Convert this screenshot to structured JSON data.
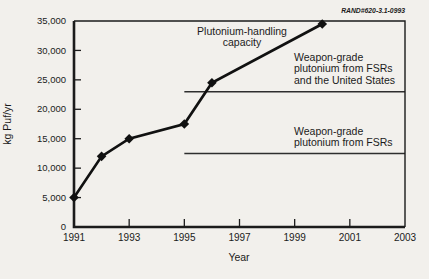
{
  "figure": {
    "tag": "RAND#620-3.1-0993",
    "background_color": "#f2f0ec",
    "ink_color": "#1b1b1b"
  },
  "chart_data": {
    "type": "line",
    "title": "",
    "xlabel": "Year",
    "ylabel": "kg Puf/yr",
    "xlim": [
      1991,
      2003
    ],
    "ylim": [
      0,
      35000
    ],
    "grid": false,
    "legend": "none (labels annotated on plot)",
    "x_ticks": [
      1991,
      1993,
      1995,
      1997,
      1999,
      2001,
      2003
    ],
    "y_ticks": [
      0,
      5000,
      10000,
      15000,
      20000,
      25000,
      30000,
      35000
    ],
    "y_tick_labels": [
      "0",
      "5,000",
      "10,000",
      "15,000",
      "20,000",
      "25,000",
      "30,000",
      "35,000"
    ],
    "series": [
      {
        "name": "Plutonium-handling capacity",
        "marker": "filled-diamond",
        "x": [
          1991,
          1992,
          1993,
          1995,
          1996,
          2000
        ],
        "y": [
          5000,
          12000,
          15000,
          17500,
          24500,
          34500
        ]
      }
    ],
    "reference_lines": [
      {
        "label": "Weapon-grade plutonium from FSRs and the United States",
        "value": 23000,
        "x_start": 1995,
        "x_end": 2003
      },
      {
        "label": "Weapon-grade plutonium from FSRs",
        "value": 12500,
        "x_start": 1995,
        "x_end": 2003
      }
    ],
    "annotations": {
      "capacity_label_line1": "Plutonium-handling",
      "capacity_label_line2": "capacity",
      "upper_ref_line1": "Weapon-grade",
      "upper_ref_line2": "plutonium from FSRs",
      "upper_ref_line3": "and the United States",
      "lower_ref_line1": "Weapon-grade",
      "lower_ref_line2": "plutonium from FSRs"
    }
  }
}
